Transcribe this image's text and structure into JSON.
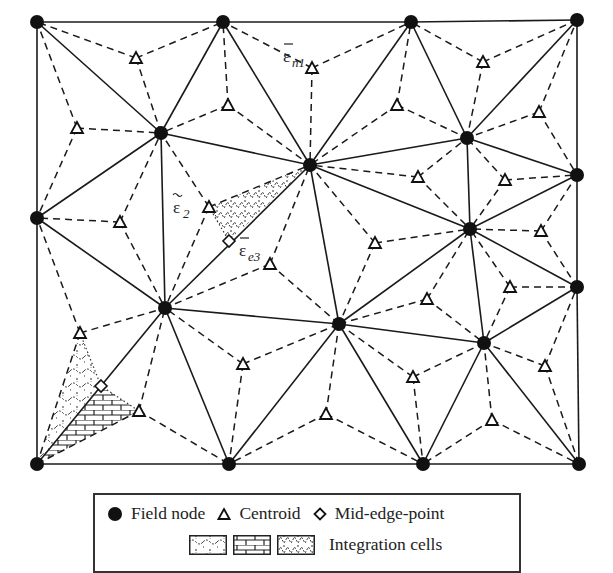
{
  "diagram": {
    "colors": {
      "line": "#1a1a1a",
      "node": "#111111",
      "background": "#ffffff"
    },
    "labels": {
      "eps_n1": {
        "main": "ε",
        "sub": "n1",
        "accent": "bar"
      },
      "eps_2": {
        "main": "ε",
        "sub": "2",
        "accent": "tilde"
      },
      "eps_e3": {
        "main": "ε",
        "sub": "e3",
        "accent": "bar"
      }
    },
    "field_nodes": [
      [
        37,
        22
      ],
      [
        223,
        22
      ],
      [
        411,
        22
      ],
      [
        577,
        20
      ],
      [
        161,
        133
      ],
      [
        310,
        165
      ],
      [
        467,
        138
      ],
      [
        577,
        175
      ],
      [
        37,
        218
      ],
      [
        470,
        229
      ],
      [
        577,
        287
      ],
      [
        165,
        308
      ],
      [
        339,
        324
      ],
      [
        484,
        343
      ],
      [
        37,
        464
      ],
      [
        229,
        464
      ],
      [
        423,
        464
      ],
      [
        579,
        464
      ]
    ],
    "triangles": [
      [
        0,
        1,
        4
      ],
      [
        0,
        4,
        8
      ],
      [
        1,
        4,
        5
      ],
      [
        1,
        2,
        5
      ],
      [
        2,
        5,
        6
      ],
      [
        2,
        3,
        6
      ],
      [
        3,
        6,
        7
      ],
      [
        6,
        7,
        9
      ],
      [
        7,
        9,
        10
      ],
      [
        5,
        6,
        9
      ],
      [
        4,
        5,
        11
      ],
      [
        4,
        8,
        11
      ],
      [
        5,
        11,
        12
      ],
      [
        5,
        9,
        12
      ],
      [
        9,
        12,
        13
      ],
      [
        9,
        10,
        13
      ],
      [
        8,
        11,
        14
      ],
      [
        11,
        14,
        15
      ],
      [
        11,
        12,
        15
      ],
      [
        12,
        13,
        16
      ],
      [
        13,
        10,
        17
      ],
      [
        12,
        15,
        16
      ],
      [
        13,
        16,
        17
      ]
    ],
    "centroids": [
      [
        136,
        58
      ],
      [
        77,
        128
      ],
      [
        228,
        105
      ],
      [
        312,
        68
      ],
      [
        397,
        105
      ],
      [
        483,
        62
      ],
      [
        539,
        112
      ],
      [
        505,
        180
      ],
      [
        541,
        231
      ],
      [
        418,
        177
      ],
      [
        209,
        207
      ],
      [
        120,
        222
      ],
      [
        270,
        264
      ],
      [
        375,
        243
      ],
      [
        427,
        299
      ],
      [
        510,
        287
      ],
      [
        80,
        333
      ],
      [
        139,
        411
      ],
      [
        243,
        364
      ],
      [
        413,
        377
      ],
      [
        545,
        366
      ],
      [
        326,
        414
      ],
      [
        492,
        420
      ]
    ],
    "mid_edge_points": [
      [
        229,
        241
      ],
      [
        101,
        386
      ]
    ]
  },
  "legend": {
    "field_node_label": "Field node",
    "centroid_label": "Centroid",
    "mid_edge_label": "Mid-edge-point",
    "integration_cells_label": "Integration cells",
    "symbols": {
      "field_node": "filled-circle",
      "centroid": "open-triangle",
      "mid_edge": "open-diamond",
      "cells": [
        "wavy-hatch",
        "brick-hatch",
        "zigzag-hatch"
      ]
    }
  }
}
